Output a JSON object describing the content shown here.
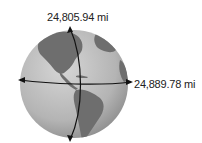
{
  "figure": {
    "labels": {
      "polar_circumference": "24,805.94 mi",
      "equatorial_circumference": "24,889.78 mi"
    },
    "colors": {
      "ocean": "#b9b9b9",
      "land": "#6f6f6f",
      "arrow": "#111111",
      "text": "#222222"
    }
  }
}
